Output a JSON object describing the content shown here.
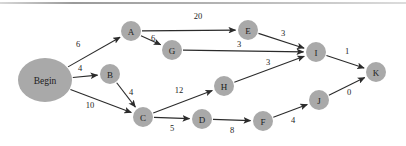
{
  "figure": {
    "background_color": "#ffffff",
    "node_color": "#a9a9a9",
    "edge_color": "#2b2b2b",
    "label_color": "#1c1c1c"
  },
  "chart_data": {
    "type": "diagram",
    "title": "",
    "xlabel": "",
    "ylabel": "",
    "directed": true,
    "nodes": [
      {
        "id": "Begin",
        "label": "Begin",
        "x": 45,
        "y": 80,
        "rx": 27,
        "ry": 22
      },
      {
        "id": "A",
        "label": "A",
        "x": 131,
        "y": 31,
        "rx": 10,
        "ry": 10
      },
      {
        "id": "B",
        "label": "B",
        "x": 110,
        "y": 74,
        "rx": 10,
        "ry": 10
      },
      {
        "id": "C",
        "label": "C",
        "x": 143,
        "y": 117,
        "rx": 10,
        "ry": 10
      },
      {
        "id": "D",
        "label": "D",
        "x": 202,
        "y": 119,
        "rx": 10,
        "ry": 10
      },
      {
        "id": "E",
        "label": "E",
        "x": 248,
        "y": 30,
        "rx": 10,
        "ry": 10
      },
      {
        "id": "F",
        "label": "F",
        "x": 263,
        "y": 121,
        "rx": 10,
        "ry": 10
      },
      {
        "id": "G",
        "label": "G",
        "x": 172,
        "y": 50,
        "rx": 10,
        "ry": 10
      },
      {
        "id": "H",
        "label": "H",
        "x": 224,
        "y": 86,
        "rx": 10,
        "ry": 10
      },
      {
        "id": "I",
        "label": "I",
        "x": 316,
        "y": 52,
        "rx": 10,
        "ry": 10
      },
      {
        "id": "J",
        "label": "J",
        "x": 319,
        "y": 100,
        "rx": 10,
        "ry": 10
      },
      {
        "id": "K",
        "label": "K",
        "x": 376,
        "y": 72,
        "rx": 10,
        "ry": 10
      }
    ],
    "edges": [
      {
        "from": "Begin",
        "to": "A",
        "weight": "6",
        "lx": 78,
        "ly": 44
      },
      {
        "from": "Begin",
        "to": "B",
        "weight": "4",
        "lx": 80,
        "ly": 68
      },
      {
        "from": "Begin",
        "to": "C",
        "weight": "10",
        "lx": 90,
        "ly": 105
      },
      {
        "from": "A",
        "to": "E",
        "weight": "20",
        "lx": 198,
        "ly": 16
      },
      {
        "from": "A",
        "to": "G",
        "weight": "6",
        "lx": 153,
        "ly": 38
      },
      {
        "from": "B",
        "to": "C",
        "weight": "4",
        "lx": 131,
        "ly": 92
      },
      {
        "from": "C",
        "to": "H",
        "weight": "12",
        "lx": 179,
        "ly": 90
      },
      {
        "from": "C",
        "to": "D",
        "weight": "5",
        "lx": 172,
        "ly": 128
      },
      {
        "from": "D",
        "to": "F",
        "weight": "8",
        "lx": 232,
        "ly": 130
      },
      {
        "from": "E",
        "to": "I",
        "weight": "3",
        "lx": 283,
        "ly": 33
      },
      {
        "from": "G",
        "to": "I",
        "weight": "3",
        "lx": 239,
        "ly": 44
      },
      {
        "from": "H",
        "to": "I",
        "weight": "3",
        "lx": 268,
        "ly": 62
      },
      {
        "from": "F",
        "to": "J",
        "weight": "4",
        "lx": 293,
        "ly": 120
      },
      {
        "from": "I",
        "to": "K",
        "weight": "1",
        "lx": 347,
        "ly": 51
      },
      {
        "from": "J",
        "to": "K",
        "weight": "0",
        "lx": 349,
        "ly": 92
      }
    ]
  }
}
